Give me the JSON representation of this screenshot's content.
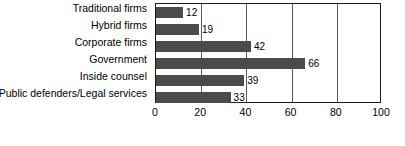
{
  "chart_data": {
    "type": "bar",
    "orientation": "horizontal",
    "title": "",
    "subtitle": "",
    "xlabel": "",
    "ylabel": "",
    "categories": [
      "Traditional firms",
      "Hybrid firms",
      "Corporate firms",
      "Government",
      "Inside counsel",
      "Public defenders/Legal services"
    ],
    "values": [
      12,
      19,
      42,
      66,
      39,
      33
    ],
    "data_labels": [
      "12",
      "19",
      "42",
      "66",
      "39",
      "33"
    ],
    "xlim": [
      0,
      100
    ],
    "xticks": [
      0,
      20,
      40,
      60,
      80,
      100
    ],
    "xtick_labels": [
      "0",
      "20",
      "40",
      "60",
      "80",
      "100"
    ],
    "grid": "vertical",
    "legend": null,
    "colors": {
      "bar": "#4b4b4b",
      "grid": "#5a5a5a",
      "frame": "#1a1a1a",
      "background": "#ffffff",
      "text": "#000000"
    }
  },
  "caption": {
    "text": ""
  }
}
